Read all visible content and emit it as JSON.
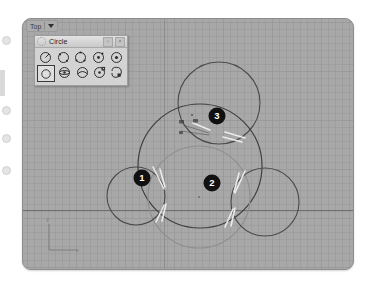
{
  "app": {
    "type": "cad-viewport",
    "viewport": {
      "label": "Top",
      "menu_caret": "dropdown-caret",
      "background_color": "#a8a8a8",
      "grid_color": "#969696",
      "axis_color": "#6f6f6f"
    },
    "axis_gizmo": {
      "y_label": "y",
      "x_label": "x"
    }
  },
  "toolbar": {
    "title": "Circle",
    "grip_icon": "circle-dotted-grip-icon",
    "buttons": [
      {
        "name": "options-button",
        "label": "▫"
      },
      {
        "name": "close-button",
        "label": "×"
      }
    ],
    "rows": [
      [
        {
          "name": "circle-center-radius-icon",
          "label": "",
          "selected": false
        },
        {
          "name": "circle-diameter-icon",
          "label": "",
          "selected": false
        },
        {
          "name": "circle-3-point-icon",
          "label": "",
          "selected": false
        },
        {
          "name": "circle-2-point-icon",
          "label": "",
          "selected": false
        },
        {
          "name": "circle-tangent-icon",
          "label": "",
          "selected": false
        }
      ],
      [
        {
          "name": "circle-deformable-icon",
          "label": "",
          "selected": true
        },
        {
          "name": "circle-around-curve-icon",
          "label": "",
          "selected": false
        },
        {
          "name": "circle-tangent-tangent-radius-icon",
          "label": "",
          "selected": false
        },
        {
          "name": "circle-fit-points-icon",
          "label": "",
          "selected": false
        },
        {
          "name": "circle-freeform-icon",
          "label": "",
          "selected": false
        }
      ]
    ]
  },
  "drawing": {
    "markers": [
      {
        "label": "1",
        "x": 141,
        "y": 177,
        "name": "point-marker-1"
      },
      {
        "label": "2",
        "x": 211,
        "y": 182,
        "name": "point-marker-2"
      },
      {
        "label": "3",
        "x": 194,
        "y": 115,
        "name": "point-marker-3"
      }
    ],
    "circles": [
      {
        "name": "top-circle",
        "cx": 196,
        "cy": 84,
        "r": 41,
        "stroke": "#4a4a4a"
      },
      {
        "name": "large-circle",
        "cx": 177,
        "cy": 147,
        "r": 62,
        "stroke": "#3f3f3f"
      },
      {
        "name": "center-circle",
        "cx": 176,
        "cy": 178,
        "r": 51,
        "stroke": "#8f8f8f"
      },
      {
        "name": "left-circle",
        "cx": 113,
        "cy": 177,
        "r": 29,
        "stroke": "#4a4a4a"
      },
      {
        "name": "right-circle",
        "cx": 242,
        "cy": 183,
        "r": 34,
        "stroke": "#4a4a4a"
      }
    ],
    "snap_hint": "Cen"
  }
}
